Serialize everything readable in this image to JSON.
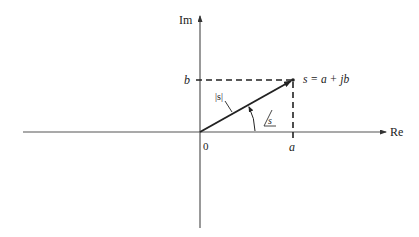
{
  "diagram": {
    "type": "complex-plane-vector",
    "axes": {
      "real_label": "Re",
      "imag_label": "Im",
      "origin_label": "0"
    },
    "point": {
      "label": "s = a + jb",
      "x_label": "a",
      "y_label": "b"
    },
    "magnitude_label": "|s|",
    "angle_label": "s",
    "colors": {
      "line": "#222222",
      "axis": "#555555",
      "background": "#ffffff"
    }
  }
}
